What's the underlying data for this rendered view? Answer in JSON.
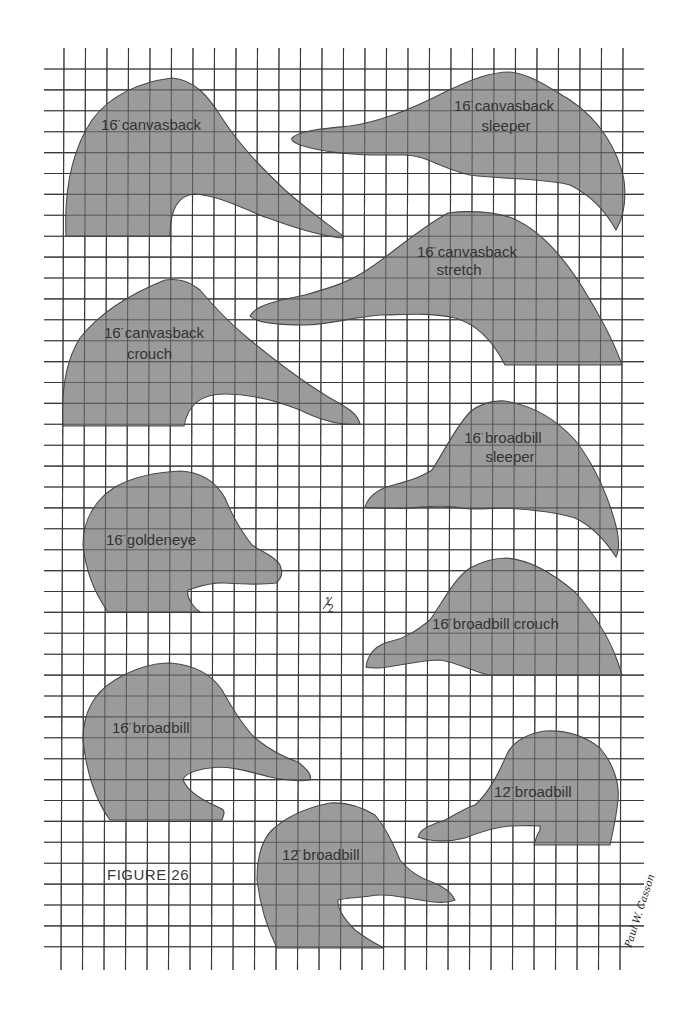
{
  "figure": {
    "title": "FIGURE 26",
    "scale_mark": "1/2",
    "signature": "Paul W. Casson"
  },
  "grid": {
    "x_start": 64,
    "x_step": 21.5,
    "x_count": 27,
    "y_start": 69,
    "y_step": 20.9,
    "y_count": 43,
    "h_line_left": 44,
    "h_line_right": 644,
    "v_line_top": 48,
    "v_line_bottom": 970,
    "line_color": "#3a3a3a",
    "fill_color": "#9b9b9b"
  },
  "patterns": [
    {
      "id": "canvasback-16",
      "label_lines": [
        "16̈ canvasback"
      ],
      "size": "16\"",
      "species": "canvasback",
      "pose": ""
    },
    {
      "id": "canvasback-sleeper-16",
      "label_lines": [
        "16̈ canvasback",
        "sleeper"
      ],
      "size": "16\"",
      "species": "canvasback",
      "pose": "sleeper"
    },
    {
      "id": "canvasback-stretch-16",
      "label_lines": [
        "16̈ canvasback",
        "stretch"
      ],
      "size": "16\"",
      "species": "canvasback",
      "pose": "stretch"
    },
    {
      "id": "canvasback-crouch-16",
      "label_lines": [
        "16̈ canvasback",
        "crouch"
      ],
      "size": "16\"",
      "species": "canvasback",
      "pose": "crouch"
    },
    {
      "id": "broadbill-sleeper-16",
      "label_lines": [
        "16̈ broadbill",
        "sleeper"
      ],
      "size": "16\"",
      "species": "broadbill",
      "pose": "sleeper"
    },
    {
      "id": "goldeneye-16",
      "label_lines": [
        "16̈ goldeneye"
      ],
      "size": "16\"",
      "species": "goldeneye",
      "pose": ""
    },
    {
      "id": "broadbill-crouch-16",
      "label_lines": [
        "16̈ broadbill crouch"
      ],
      "size": "16\"",
      "species": "broadbill",
      "pose": "crouch"
    },
    {
      "id": "broadbill-16",
      "label_lines": [
        "16̈ broadbill"
      ],
      "size": "16\"",
      "species": "broadbill",
      "pose": ""
    },
    {
      "id": "broadbill-12-right",
      "label_lines": [
        "12̈ broadbill"
      ],
      "size": "12\"",
      "species": "broadbill",
      "pose": ""
    },
    {
      "id": "broadbill-12-bottom",
      "label_lines": [
        "12̈ broadbill"
      ],
      "size": "12\"",
      "species": "broadbill",
      "pose": ""
    }
  ]
}
